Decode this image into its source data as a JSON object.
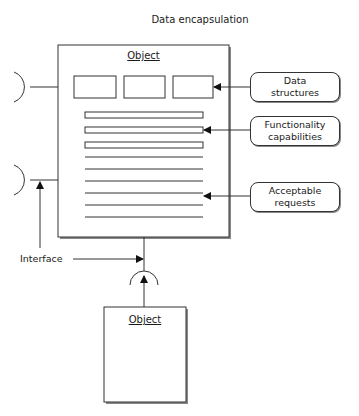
{
  "title": "Data encapsulation",
  "main_object": {
    "label": "Object"
  },
  "client_object": {
    "label": "Object"
  },
  "callouts": [
    {
      "line1": "Data",
      "line2": "structures"
    },
    {
      "line1": "Functionality",
      "line2": "capabilities"
    },
    {
      "line1": "Acceptable",
      "line2": "requests"
    }
  ],
  "interface_label": "Interface",
  "colors": {
    "stroke": "#333333",
    "shadow": "#888888",
    "background": "#ffffff"
  }
}
